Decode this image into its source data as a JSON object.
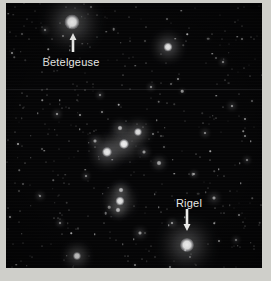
{
  "image": {
    "subject": "Orion constellation star field",
    "plate_background": "#050506",
    "paper_background": "#cfcfca",
    "star_color": "#ffffff",
    "label_color": "#e8e8e6"
  },
  "annotations": [
    {
      "id": "betelgeuse",
      "label": "Betelgeuse",
      "label_x": 71,
      "label_y": 62,
      "arrow_direction": "up",
      "arrow_x": 73,
      "arrow_top": 33,
      "arrow_height": 19,
      "target_star_x": 72,
      "target_star_y": 22
    },
    {
      "id": "rigel",
      "label": "Rigel",
      "label_x": 189,
      "label_y": 203,
      "arrow_direction": "down",
      "arrow_x": 187,
      "arrow_top": 209,
      "arrow_height": 22,
      "target_star_x": 187,
      "target_star_y": 245
    }
  ],
  "bright_stars": [
    {
      "name": "Betelgeuse",
      "x": 72,
      "y": 22,
      "size": 15,
      "glow": 22,
      "brightness": 1.0
    },
    {
      "name": "Rigel",
      "x": 187,
      "y": 245,
      "size": 14,
      "glow": 21,
      "brightness": 1.0
    },
    {
      "name": "Bellatrix",
      "x": 168,
      "y": 47,
      "size": 9,
      "glow": 13,
      "brightness": 0.9
    },
    {
      "name": "Saiph",
      "x": 77,
      "y": 256,
      "size": 8,
      "glow": 12,
      "brightness": 0.85
    },
    {
      "name": "Alnilam",
      "x": 124,
      "y": 144,
      "size": 10,
      "glow": 15,
      "brightness": 0.95
    },
    {
      "name": "Mintaka",
      "x": 138,
      "y": 132,
      "size": 8,
      "glow": 12,
      "brightness": 0.88
    },
    {
      "name": "Alnitak",
      "x": 107,
      "y": 152,
      "size": 10,
      "glow": 14,
      "brightness": 0.92
    },
    {
      "name": "Orion Nebula",
      "x": 120,
      "y": 201,
      "size": 9,
      "glow": 14,
      "brightness": 0.9
    },
    {
      "name": "Sword Star Upper",
      "x": 121,
      "y": 190,
      "size": 5,
      "glow": 8,
      "brightness": 0.7
    },
    {
      "name": "Sword Star Lower",
      "x": 118,
      "y": 210,
      "size": 5,
      "glow": 8,
      "brightness": 0.7
    },
    {
      "name": "Meissa",
      "x": 120,
      "y": 128,
      "size": 5,
      "glow": 8,
      "brightness": 0.7
    },
    {
      "name": "Field Star A",
      "x": 159,
      "y": 163,
      "size": 5,
      "glow": 7,
      "brightness": 0.65
    },
    {
      "name": "Field Star B",
      "x": 144,
      "y": 152,
      "size": 4,
      "glow": 6,
      "brightness": 0.6
    },
    {
      "name": "Field Star C",
      "x": 95,
      "y": 141,
      "size": 4,
      "glow": 6,
      "brightness": 0.6
    },
    {
      "name": "Field Star D",
      "x": 214,
      "y": 198,
      "size": 4,
      "glow": 6,
      "brightness": 0.6
    },
    {
      "name": "Field Star E",
      "x": 140,
      "y": 233,
      "size": 4,
      "glow": 6,
      "brightness": 0.6
    },
    {
      "name": "Field Star F",
      "x": 172,
      "y": 223,
      "size": 3,
      "glow": 5,
      "brightness": 0.55
    },
    {
      "name": "Field Star G",
      "x": 57,
      "y": 114,
      "size": 3,
      "glow": 5,
      "brightness": 0.55
    },
    {
      "name": "Field Star H",
      "x": 232,
      "y": 106,
      "size": 3,
      "glow": 5,
      "brightness": 0.55
    },
    {
      "name": "Field Star I",
      "x": 205,
      "y": 133,
      "size": 3,
      "glow": 5,
      "brightness": 0.5
    },
    {
      "name": "Field Star J",
      "x": 40,
      "y": 196,
      "size": 3,
      "glow": 5,
      "brightness": 0.5
    },
    {
      "name": "Field Star K",
      "x": 100,
      "y": 95,
      "size": 3,
      "glow": 4,
      "brightness": 0.5
    },
    {
      "name": "Field Star L",
      "x": 223,
      "y": 62,
      "size": 3,
      "glow": 4,
      "brightness": 0.5
    },
    {
      "name": "Field Star M",
      "x": 45,
      "y": 30,
      "size": 3,
      "glow": 4,
      "brightness": 0.5
    },
    {
      "name": "Field Star N",
      "x": 151,
      "y": 87,
      "size": 3,
      "glow": 4,
      "brightness": 0.5
    },
    {
      "name": "Field Star O",
      "x": 194,
      "y": 174,
      "size": 3,
      "glow": 4,
      "brightness": 0.5
    },
    {
      "name": "Field Star P",
      "x": 86,
      "y": 176,
      "size": 3,
      "glow": 4,
      "brightness": 0.5
    },
    {
      "name": "Field Star Q",
      "x": 60,
      "y": 223,
      "size": 3,
      "glow": 4,
      "brightness": 0.5
    },
    {
      "name": "Field Star R",
      "x": 236,
      "y": 240,
      "size": 3,
      "glow": 4,
      "brightness": 0.5
    },
    {
      "name": "Field Star S",
      "x": 247,
      "y": 160,
      "size": 3,
      "glow": 4,
      "brightness": 0.5
    }
  ],
  "seam": {
    "y": 89
  },
  "faint_star_count": 420
}
